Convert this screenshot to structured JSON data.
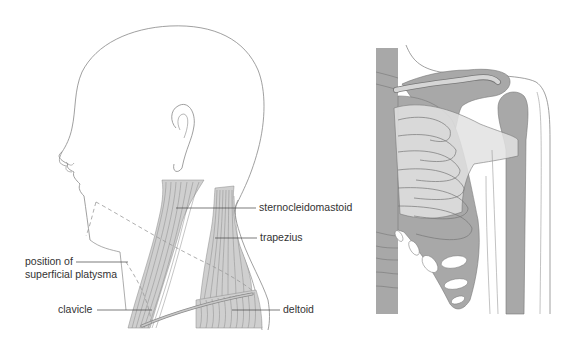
{
  "figure": {
    "panels": [
      {
        "id": "left",
        "description": "lateral view of head and neck muscles"
      },
      {
        "id": "right",
        "description": "anterior view of shoulder, ribcage and pectoral region"
      }
    ],
    "labels": {
      "sternocleidomastoid": "sternocleidomastoid",
      "trapezius": "trapezius",
      "platysma_line1": "position of",
      "platysma_line2": "superficial platysma",
      "clavicle": "clavicle",
      "deltoid": "deltoid"
    },
    "colors": {
      "outline": "#777777",
      "muscle_fill": "#cfcfcf",
      "muscle_fiber": "#8a8a8a",
      "bone_dark": "#a8a8a8",
      "bone_light": "#d9d9d9",
      "muscle_overlay": "#e6e6e6",
      "leader_line": "#444444",
      "text": "#333333"
    }
  }
}
